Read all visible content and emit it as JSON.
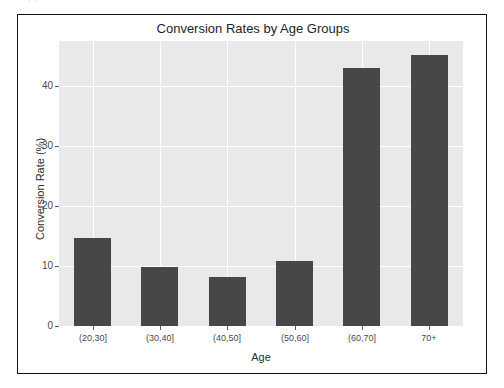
{
  "artifact": {
    "top_text": "clipped text row"
  },
  "chart_data": {
    "type": "bar",
    "title": "Conversion Rates by Age Groups",
    "xlabel": "Age",
    "ylabel": "Conversion Rate (%)",
    "categories": [
      "(20,30]",
      "(30,40]",
      "(40,50]",
      "(50,60]",
      "(60,70]",
      "70+"
    ],
    "values": [
      14.7,
      9.9,
      8.1,
      10.8,
      43.0,
      45.2
    ],
    "ylim": [
      0,
      47.5
    ],
    "yticks": [
      0,
      10,
      20,
      30,
      40
    ],
    "ytick_labels": [
      "0",
      "10",
      "20",
      "30",
      "40"
    ],
    "grid": true,
    "legend": "none",
    "bar_color": "#474747",
    "plot_background": "#e9e9ec",
    "gridline_color": "#ffffff",
    "frame_color": "#111111",
    "figure_background": "#ffffff"
  }
}
